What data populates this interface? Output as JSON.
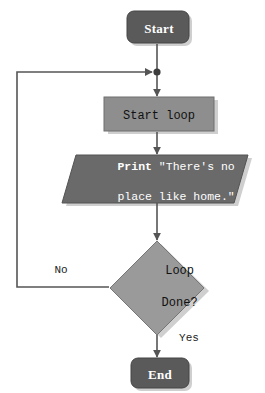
{
  "diagram": {
    "type": "flowchart",
    "title": "",
    "colors": {
      "terminal_fill": "#5a5a5a",
      "process_fill": "#8e8e8e",
      "io_fill": "#6a6a6a",
      "decision_fill": "#9a9a9a",
      "shadow": "#cfcfcf",
      "stroke": "#4a4a4a",
      "line": "#555555",
      "background": "#ffffff",
      "terminal_text": "#ffffff",
      "io_text": "#ffffff",
      "process_text": "#111111"
    },
    "nodes": [
      {
        "id": "start",
        "shape": "terminal",
        "label": "Start"
      },
      {
        "id": "start_loop",
        "shape": "process",
        "label": "Start loop"
      },
      {
        "id": "print",
        "shape": "parallelogram",
        "label_keyword": "Print",
        "label_rest": " \"There's no",
        "label_line2": "place like home.\""
      },
      {
        "id": "loop_done",
        "shape": "decision",
        "label_line1": "Loop",
        "label_line2": "Done?"
      },
      {
        "id": "end",
        "shape": "terminal",
        "label": "End"
      }
    ],
    "edges": [
      {
        "id": "start-to-junction",
        "from": "start",
        "to": "junction",
        "label": ""
      },
      {
        "id": "junction-to-startloop",
        "from": "junction",
        "to": "start_loop",
        "label": ""
      },
      {
        "id": "startloop-to-print",
        "from": "start_loop",
        "to": "print",
        "label": ""
      },
      {
        "id": "print-to-decision",
        "from": "print",
        "to": "loop_done",
        "label": ""
      },
      {
        "id": "decision-no-loopback",
        "from": "loop_done",
        "to": "junction",
        "label": "No"
      },
      {
        "id": "decision-yes-to-end",
        "from": "loop_done",
        "to": "end",
        "label": "Yes"
      }
    ]
  }
}
